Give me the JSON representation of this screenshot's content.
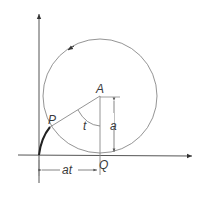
{
  "diagram": {
    "type": "cycloid-construction",
    "labels": {
      "center": "A",
      "point": "P",
      "contact": "Q",
      "angle": "t",
      "radius": "a",
      "distance": "at"
    },
    "colors": {
      "line": "#6a6a6a",
      "curve": "#222222",
      "text": "#3a3a3a"
    }
  }
}
